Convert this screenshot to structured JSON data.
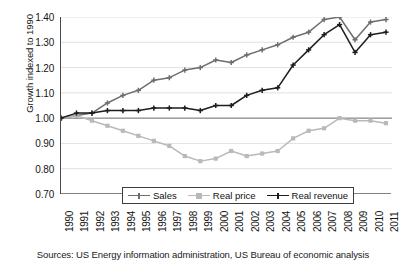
{
  "chart_data": {
    "type": "line",
    "title": "",
    "xlabel": "",
    "ylabel": "Growth indexed to 1990",
    "source_note": "Sources: US Energy information administration, US Bureau of economic analysis",
    "grid": true,
    "legend_position": "bottom-center",
    "ylim": [
      0.7,
      1.4
    ],
    "ytick_labels": [
      "1.40",
      "1.30",
      "1.20",
      "1.10",
      "1.00",
      "0.90",
      "0.80",
      "0.70"
    ],
    "ytick_values": [
      1.4,
      1.3,
      1.2,
      1.1,
      1.0,
      0.9,
      0.8,
      0.7
    ],
    "categories": [
      "1990",
      "1991",
      "1992",
      "1993",
      "1994",
      "1995",
      "1996",
      "1997",
      "1998",
      "1999",
      "2000",
      "2001",
      "2002",
      "2003",
      "2004",
      "2005",
      "2006",
      "2007",
      "2008",
      "2009",
      "2010",
      "2011"
    ],
    "x": [
      1990,
      1991,
      1992,
      1993,
      1994,
      1995,
      1996,
      1997,
      1998,
      1999,
      2000,
      2001,
      2002,
      2003,
      2004,
      2005,
      2006,
      2007,
      2008,
      2009,
      2010,
      2011
    ],
    "series": [
      {
        "name": "Sales",
        "color": "#6e6e6e",
        "marker": "cross",
        "values": [
          1.0,
          1.01,
          1.02,
          1.06,
          1.09,
          1.11,
          1.15,
          1.16,
          1.19,
          1.2,
          1.23,
          1.22,
          1.25,
          1.27,
          1.29,
          1.32,
          1.34,
          1.39,
          1.4,
          1.31,
          1.38,
          1.39
        ]
      },
      {
        "name": "Real price",
        "color": "#b9b9b9",
        "marker": "square",
        "values": [
          1.0,
          1.01,
          0.99,
          0.97,
          0.95,
          0.93,
          0.91,
          0.89,
          0.85,
          0.83,
          0.84,
          0.87,
          0.85,
          0.86,
          0.87,
          0.92,
          0.95,
          0.96,
          1.0,
          0.99,
          0.99,
          0.98
        ]
      },
      {
        "name": "Real revenue",
        "color": "#1d1d1d",
        "marker": "cross",
        "values": [
          1.0,
          1.02,
          1.02,
          1.03,
          1.03,
          1.03,
          1.04,
          1.04,
          1.04,
          1.03,
          1.05,
          1.05,
          1.09,
          1.11,
          1.12,
          1.21,
          1.27,
          1.33,
          1.37,
          1.26,
          1.33,
          1.34
        ]
      }
    ]
  },
  "legend": {
    "items": [
      {
        "label": "Sales"
      },
      {
        "label": "Real price"
      },
      {
        "label": "Real revenue"
      }
    ]
  }
}
